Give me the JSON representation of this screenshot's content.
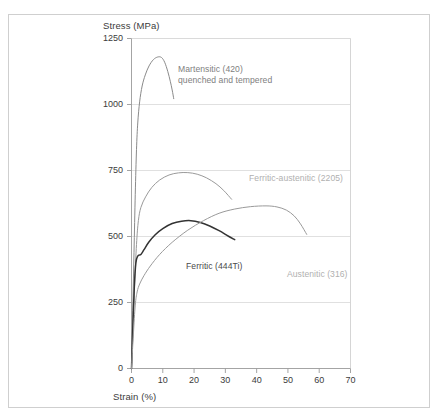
{
  "figure": {
    "background_color": "#ffffff",
    "frame_color": "#cfcfcf"
  },
  "chart_data": {
    "type": "line",
    "title": "",
    "xlabel": "Strain (%)",
    "ylabel": "Stress (MPa)",
    "xlim": [
      0,
      70
    ],
    "ylim": [
      0,
      1250
    ],
    "xticks": [
      0,
      10,
      20,
      30,
      40,
      50,
      60,
      70
    ],
    "yticks": [
      0,
      250,
      500,
      750,
      1000,
      1250
    ],
    "xtick_labels": [
      "0",
      "10",
      "20",
      "30",
      "40",
      "50",
      "60",
      "70"
    ],
    "ytick_labels": [
      "0",
      "250",
      "500",
      "750",
      "1000",
      "1250"
    ],
    "grid": "horizontal",
    "legend": "inline-annotations",
    "series": [
      {
        "name": "Martensitic (420) quenched and tempered",
        "color": "#8a8a8a",
        "peak_stress": 1180,
        "peak_strain": 9.5,
        "end_strain": 13.5,
        "end_stress": 1020,
        "points": [
          [
            0,
            0
          ],
          [
            0.4,
            220
          ],
          [
            0.8,
            440
          ],
          [
            1.2,
            660
          ],
          [
            1.6,
            830
          ],
          [
            2.0,
            930
          ],
          [
            2.6,
            1010
          ],
          [
            3.4,
            1070
          ],
          [
            4.4,
            1112
          ],
          [
            5.6,
            1146
          ],
          [
            7.0,
            1170
          ],
          [
            8.4,
            1180
          ],
          [
            9.6,
            1178
          ],
          [
            10.6,
            1160
          ],
          [
            11.6,
            1125
          ],
          [
            12.4,
            1088
          ],
          [
            13.0,
            1055
          ],
          [
            13.5,
            1022
          ]
        ]
      },
      {
        "name": "Ferritic-austenitic (2205)",
        "color": "#9a9a9a",
        "peak_stress": 742,
        "peak_strain": 19,
        "end_strain": 32,
        "end_stress": 640,
        "points": [
          [
            0,
            0
          ],
          [
            0.5,
            160
          ],
          [
            1.0,
            320
          ],
          [
            1.6,
            470
          ],
          [
            2.2,
            560
          ],
          [
            3.0,
            610
          ],
          [
            4.5,
            650
          ],
          [
            6.5,
            686
          ],
          [
            9.0,
            714
          ],
          [
            12.0,
            733
          ],
          [
            15.0,
            741
          ],
          [
            18.0,
            742
          ],
          [
            21.0,
            736
          ],
          [
            24.0,
            722
          ],
          [
            27.0,
            700
          ],
          [
            29.5,
            674
          ],
          [
            32.0,
            641
          ]
        ]
      },
      {
        "name": "Ferritic (444Ti)",
        "color": "#333333",
        "peak_stress": 560,
        "peak_strain": 18,
        "end_strain": 33,
        "end_stress": 488,
        "points": [
          [
            0,
            0
          ],
          [
            0.4,
            150
          ],
          [
            0.9,
            310
          ],
          [
            1.4,
            400
          ],
          [
            2.0,
            426
          ],
          [
            3.0,
            432
          ],
          [
            4.0,
            450
          ],
          [
            5.5,
            478
          ],
          [
            7.5,
            506
          ],
          [
            10.0,
            530
          ],
          [
            13.0,
            549
          ],
          [
            16.0,
            558
          ],
          [
            19.0,
            560
          ],
          [
            22.0,
            553
          ],
          [
            25.0,
            540
          ],
          [
            28.0,
            522
          ],
          [
            31.0,
            501
          ],
          [
            33.0,
            488
          ]
        ]
      },
      {
        "name": "Austenitic (316)",
        "color": "#9a9a9a",
        "peak_stress": 616,
        "peak_strain": 47,
        "end_strain": 56,
        "end_stress": 508,
        "points": [
          [
            0,
            0
          ],
          [
            0.6,
            130
          ],
          [
            1.2,
            240
          ],
          [
            1.8,
            290
          ],
          [
            2.6,
            320
          ],
          [
            4.0,
            352
          ],
          [
            6.0,
            388
          ],
          [
            9.0,
            432
          ],
          [
            13.0,
            478
          ],
          [
            18.0,
            524
          ],
          [
            23.0,
            560
          ],
          [
            28.0,
            588
          ],
          [
            33.0,
            604
          ],
          [
            38.0,
            613
          ],
          [
            43.0,
            616
          ],
          [
            46.5,
            612
          ],
          [
            49.5,
            600
          ],
          [
            52.0,
            578
          ],
          [
            54.0,
            548
          ],
          [
            56.0,
            508
          ]
        ]
      }
    ],
    "annotations": [
      {
        "id": "martensitic",
        "lines": [
          "Martensitic (420)",
          "quenched and tempered"
        ],
        "color": "#808080",
        "x_px": 178,
        "y_px": 64
      },
      {
        "id": "ferritic-austenitic",
        "lines": [
          "Ferritic-austenitic (2205)"
        ],
        "color": "#b0b0b0",
        "x_px": 249,
        "y_px": 173
      },
      {
        "id": "ferritic",
        "lines": [
          "Ferritic (444Ti)"
        ],
        "color": "#4a4a4a",
        "x_px": 186,
        "y_px": 261
      },
      {
        "id": "austenitic",
        "lines": [
          "Austenitic (316)"
        ],
        "color": "#b0b0b0",
        "x_px": 287,
        "y_px": 269
      }
    ]
  }
}
